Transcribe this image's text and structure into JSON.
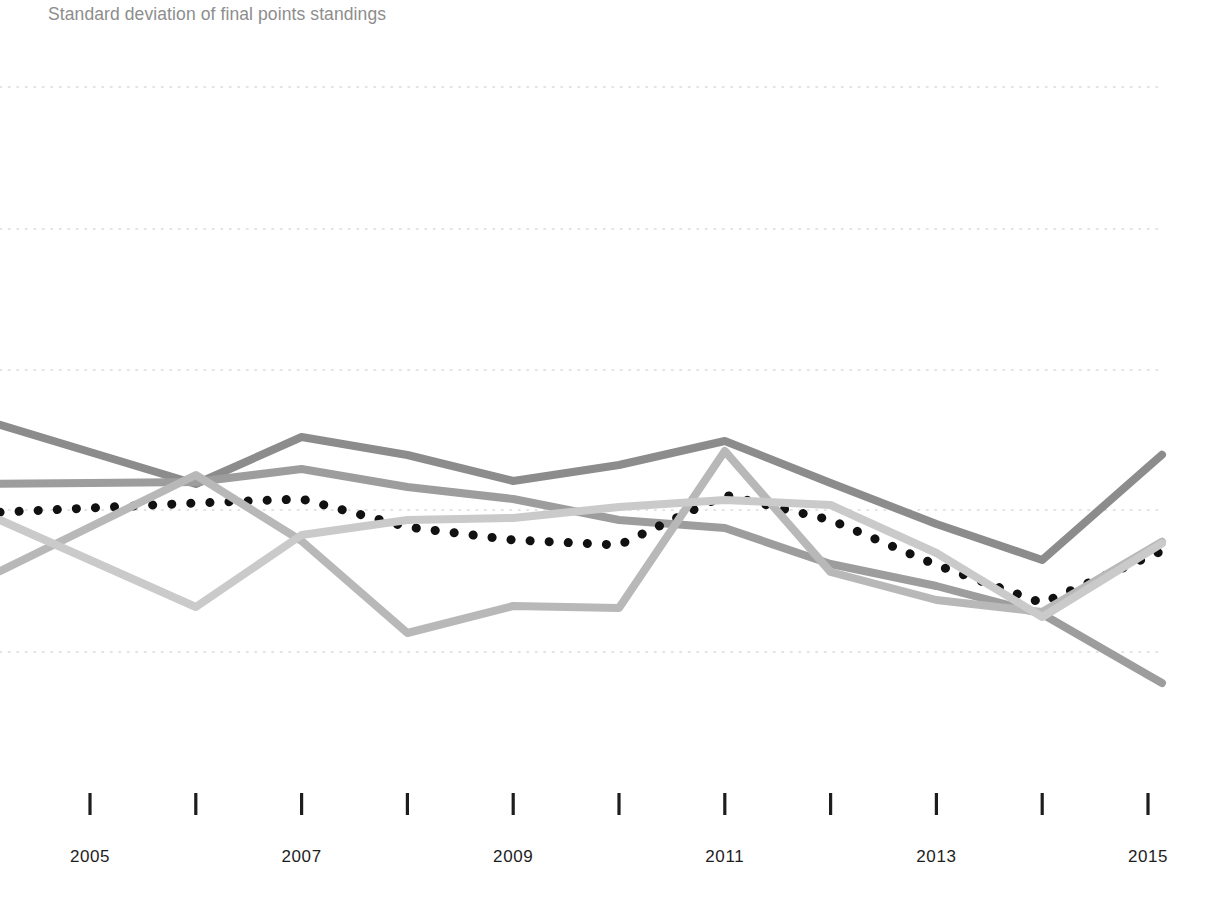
{
  "title": "Standard deviation of final points standings",
  "axis": {
    "x_tick_labels": [
      "2005",
      "2007",
      "2009",
      "2011",
      "2013",
      "2015"
    ],
    "x_all_ticks": [
      "2005",
      "2006",
      "2007",
      "2008",
      "2009",
      "2010",
      "2011",
      "2012",
      "2013",
      "2014",
      "2015"
    ],
    "tick_color": "#1d1d1d",
    "grid_color": "#d8d8d8"
  },
  "colors": {
    "series_dark_gray": "#8c8c8c",
    "series_mid_gray": "#9d9d9d",
    "series_light_gray": "#b8b8b8",
    "series_pale_gray": "#cacaca",
    "series_dotted_black": "#111111",
    "title_gray": "#8d8d8d",
    "grid_gray": "#dadada"
  },
  "chart_data": {
    "type": "line",
    "title": "Standard deviation of final points standings",
    "xlabel": "",
    "ylabel": "",
    "grid": true,
    "legend": "none",
    "x": [
      2005,
      2006,
      2007,
      2008,
      2009,
      2010,
      2011,
      2012,
      2013,
      2014,
      2015
    ],
    "xlim": [
      2005,
      2015
    ],
    "ylim": [
      0,
      5
    ],
    "y_gridlines_px": [
      87,
      229,
      370,
      510,
      652
    ],
    "series": [
      {
        "name": "series-dark-gray",
        "style": "solid",
        "color": "#8c8c8c",
        "values_px_y": [
          452,
          484,
          437,
          455,
          481,
          465,
          441,
          483,
          524,
          560,
          467
        ],
        "values": [
          2.07,
          1.84,
          2.17,
          2.05,
          1.87,
          1.98,
          2.15,
          1.85,
          1.56,
          1.31,
          1.97
        ]
      },
      {
        "name": "series-mid-gray",
        "style": "solid",
        "color": "#9d9d9d",
        "values_px_y": [
          483,
          482,
          469,
          487,
          499,
          520,
          528,
          564,
          586,
          614,
          675
        ],
        "values": [
          1.85,
          1.86,
          1.95,
          1.82,
          1.74,
          1.59,
          1.54,
          1.28,
          1.13,
          0.93,
          0.5
        ]
      },
      {
        "name": "series-dotted-black",
        "style": "dotted",
        "color": "#111111",
        "values_px_y": [
          508,
          503,
          499,
          527,
          540,
          545,
          495,
          520,
          565,
          603,
          557
        ],
        "values": [
          1.67,
          1.7,
          1.73,
          1.53,
          1.44,
          1.4,
          1.76,
          1.58,
          1.26,
          0.99,
          1.31
        ]
      },
      {
        "name": "series-light-gray",
        "style": "solid",
        "color": "#b8b8b8",
        "values_px_y": [
          527,
          475,
          541,
          633,
          606,
          608,
          451,
          572,
          600,
          612,
          550
        ],
        "values": [
          1.53,
          1.91,
          1.44,
          0.78,
          0.98,
          0.96,
          2.08,
          1.21,
          1.01,
          0.93,
          1.37
        ]
      },
      {
        "name": "series-pale-gray",
        "style": "solid",
        "color": "#cacaca",
        "values_px_y": [
          560,
          607,
          535,
          520,
          518,
          507,
          500,
          505,
          553,
          617,
          552
        ],
        "values": [
          1.3,
          0.97,
          1.48,
          1.58,
          1.6,
          1.67,
          1.72,
          1.68,
          1.34,
          0.9,
          1.35
        ]
      }
    ]
  }
}
